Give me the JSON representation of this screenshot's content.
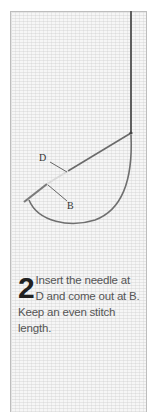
{
  "illustration": {
    "title": "Stitch diagram",
    "labels": {
      "d": "D",
      "b": "B"
    },
    "thread_color": "#6a6a6a"
  },
  "step": {
    "number": "2",
    "text": "Insert the needle at D and come out at B. Keep an even stitch length."
  }
}
